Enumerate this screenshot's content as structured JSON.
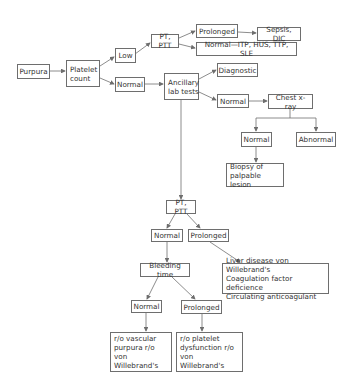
{
  "diagram": {
    "type": "flowchart",
    "colors": {
      "line": "#6e6e6e",
      "text": "#333333",
      "background": "#ffffff"
    },
    "nodes": {
      "purpura": "Purpura",
      "platelet_count": "Platelet\ncount",
      "low": "Low",
      "normal_platelet": "Normal",
      "pt_ptt_low": "PT, PTT",
      "prolonged_low": "Prolonged",
      "sepsis_dic": "Sepsis, DIC",
      "normal_itp": "Normal—ITP, HUS, TTP, SLE",
      "ancillary": "Ancillary\nlab tests",
      "diagnostic": "Diagnostic",
      "normal_ancillary": "Normal",
      "chest_xray": "Chest x-ray",
      "normal_xray": "Normal",
      "abnormal_xray": "Abnormal",
      "biopsy": "Biopsy of\npalpable lesion",
      "pt_ptt_2": "PT, PTT",
      "normal_pt": "Normal",
      "prolonged_pt": "Prolonged",
      "liver": "Liver disease von Willebrand's\nCoagulation factor deficience\nCirculating anticoagulant",
      "bleeding_time": "Bleeding time",
      "normal_bt": "Normal",
      "prolonged_bt": "Prolonged",
      "ro_vascular": "r/o vascular\npurpura r/o\nvon Willebrand's",
      "ro_platelet": "r/o platelet\ndysfunction r/o\nvon Willebrand's"
    }
  }
}
